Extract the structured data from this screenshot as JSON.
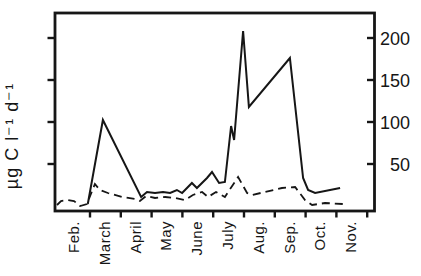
{
  "figure": {
    "background": "#ffffff",
    "ink_color": "#161616"
  },
  "chart_data": {
    "type": "line",
    "title": "",
    "xlabel": "",
    "ylabel": "µg C l⁻¹ d⁻¹",
    "x_tick_labels": [
      "Feb.",
      "March",
      "April",
      "May",
      "June",
      "July",
      "Aug.",
      "Sep.",
      "Oct.",
      "Nov."
    ],
    "y_tick_values": [
      50,
      100,
      150,
      200
    ],
    "y_tick_labels": [
      "50",
      "100",
      "150",
      "200"
    ],
    "y_tick_label_side": "right",
    "ylim": [
      0,
      230
    ],
    "grid": false,
    "legend": "none",
    "x_unit": "month position: 0 = Feb tick, 1 = March tick ... 9 = Nov tick (fractional between ticks)",
    "y_unit": "µg C l⁻¹ d⁻¹",
    "series": [
      {
        "name": "solid-line",
        "style": "solid",
        "points": [
          [
            -0.07,
            2.4
          ],
          [
            0.42,
            102.4
          ],
          [
            1.66,
            10.7
          ],
          [
            1.85,
            16.7
          ],
          [
            2.11,
            15.5
          ],
          [
            2.37,
            16.7
          ],
          [
            2.6,
            15.5
          ],
          [
            2.82,
            19.0
          ],
          [
            2.99,
            15.5
          ],
          [
            3.31,
            27.4
          ],
          [
            3.47,
            21.4
          ],
          [
            3.8,
            33.3
          ],
          [
            3.96,
            40.5
          ],
          [
            4.19,
            27.4
          ],
          [
            4.38,
            28.6
          ],
          [
            4.58,
            95.2
          ],
          [
            4.68,
            78.6
          ],
          [
            4.97,
            208.3
          ],
          [
            5.16,
            117.9
          ],
          [
            6.49,
            176.2
          ],
          [
            6.92,
            33.3
          ],
          [
            7.08,
            19.0
          ],
          [
            7.31,
            15.5
          ],
          [
            8.12,
            21.4
          ]
        ]
      },
      {
        "name": "dashed-line",
        "style": "dashed",
        "points": [
          [
            -1.07,
            1.2
          ],
          [
            -0.94,
            6.0
          ],
          [
            -0.71,
            7.1
          ],
          [
            -0.52,
            6.0
          ],
          [
            -0.32,
            0.0
          ],
          [
            -0.1,
            2.4
          ],
          [
            0.16,
            26.2
          ],
          [
            0.32,
            19.0
          ],
          [
            0.58,
            15.5
          ],
          [
            1.04,
            10.7
          ],
          [
            1.46,
            8.3
          ],
          [
            1.62,
            6.0
          ],
          [
            1.82,
            11.9
          ],
          [
            2.11,
            9.5
          ],
          [
            2.44,
            10.7
          ],
          [
            2.76,
            9.5
          ],
          [
            3.08,
            7.1
          ],
          [
            3.34,
            13.1
          ],
          [
            3.64,
            16.7
          ],
          [
            3.83,
            10.7
          ],
          [
            4.09,
            16.7
          ],
          [
            4.38,
            10.7
          ],
          [
            4.81,
            34.5
          ],
          [
            5.1,
            15.5
          ],
          [
            5.26,
            13.1
          ],
          [
            5.68,
            16.7
          ],
          [
            6.23,
            21.4
          ],
          [
            6.66,
            22.6
          ],
          [
            6.98,
            7.1
          ],
          [
            7.21,
            1.2
          ],
          [
            7.63,
            3.6
          ],
          [
            8.21,
            2.4
          ]
        ]
      }
    ]
  }
}
